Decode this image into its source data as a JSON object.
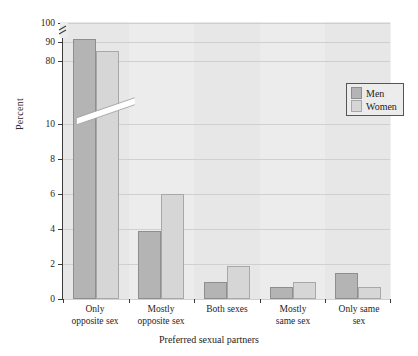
{
  "chart_data": {
    "type": "bar",
    "title": "",
    "xlabel": "Preferred sexual partners",
    "ylabel": "Percent",
    "categories": [
      "Only\nopposite sex",
      "Mostly\nopposite sex",
      "Both sexes",
      "Mostly\nsame sex",
      "Only same\nsex"
    ],
    "category_lines": [
      [
        "Only",
        "opposite sex"
      ],
      [
        "Mostly",
        "opposite sex"
      ],
      [
        "Both sexes",
        ""
      ],
      [
        "Mostly",
        "same sex"
      ],
      [
        "Only same",
        "sex"
      ]
    ],
    "series": [
      {
        "name": "Men",
        "color": "#b4b4b4",
        "values": [
          91.5,
          3.9,
          1.0,
          0.7,
          1.5
        ]
      },
      {
        "name": "Women",
        "color": "#d6d6d6",
        "values": [
          85.5,
          10.2,
          1.9,
          1.0,
          0.7
        ]
      }
    ],
    "y_axis": {
      "broken": true,
      "lower_segment": {
        "min": 0,
        "max": 10,
        "ticks": [
          0,
          2,
          4,
          6,
          8,
          10
        ]
      },
      "upper_segment": {
        "min": 80,
        "max": 100,
        "ticks": [
          80,
          90,
          100
        ]
      },
      "tick_labels": [
        "0",
        "2",
        "4",
        "6",
        "8",
        "10",
        "80",
        "90",
        "100"
      ]
    },
    "grid": true,
    "legend_position": "upper-right",
    "legend_entries": [
      "Men",
      "Women"
    ]
  },
  "legend": {
    "men_label": "Men",
    "women_label": "Women"
  },
  "axes": {
    "y_title": "Percent",
    "x_title": "Preferred sexual partners",
    "y_ticks": {
      "t0": "0",
      "t2": "2",
      "t4": "4",
      "t6": "6",
      "t8": "8",
      "t10": "10",
      "t80": "80",
      "t90": "90",
      "t100": "100"
    }
  },
  "x_labels": [
    {
      "line1": "Only",
      "line2": "opposite sex"
    },
    {
      "line1": "Mostly",
      "line2": "opposite sex"
    },
    {
      "line1": "Both sexes",
      "line2": ""
    },
    {
      "line1": "Mostly",
      "line2": "same sex"
    },
    {
      "line1": "Only same",
      "line2": "sex"
    }
  ]
}
